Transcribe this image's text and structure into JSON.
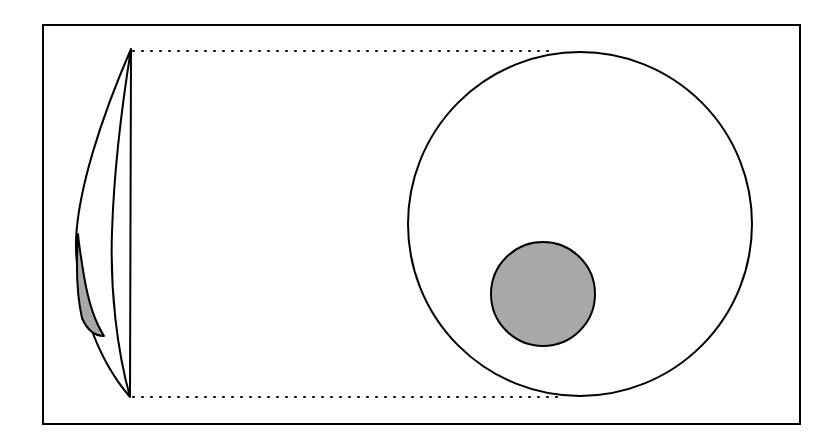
{
  "figure": {
    "title": "Lens and circle geometric diagram",
    "canvas": {
      "width": 838,
      "height": 441,
      "background": "#ffffff"
    },
    "ink_color": "#000000",
    "shade_color": "#a8a8a8",
    "frame": {
      "name": "outer border rectangle",
      "x": 43,
      "y": 25,
      "width": 757,
      "height": 399,
      "stroke": "#000000",
      "stroke_width": 2,
      "fill": "none"
    },
    "guides": [
      {
        "name": "upper dotted tangent line",
        "style": "dotted",
        "x1": 133,
        "y1": 51,
        "x2": 556,
        "y2": 51,
        "stroke": "#000000",
        "stroke_width": 2,
        "dash": "1 8"
      },
      {
        "name": "lower dotted tangent line",
        "style": "dotted",
        "x1": 133,
        "y1": 397,
        "x2": 558,
        "y2": 397,
        "stroke": "#000000",
        "stroke_width": 2,
        "dash": "1 8"
      }
    ],
    "lens": {
      "name": "thin crescent lens shape",
      "top_tip": {
        "x": 131,
        "y": 49
      },
      "bottom_tip": {
        "x": 130,
        "y": 397
      },
      "outer_arc_extreme": {
        "x": 76,
        "y": 240
      },
      "inner_arc_extreme": {
        "x": 112,
        "y": 232
      },
      "stroke": "#000000",
      "stroke_width": 2,
      "fill": "#ffffff",
      "outer_path": "M131,49 C101,118 78,190 76,240 C75,300 98,360 130,397",
      "inner_path": "M130,397 C117,350 110,290 112,232 C114,170 122,105 131,49"
    },
    "shaded_sliver": {
      "name": "gray shaded sliver inside lens",
      "fill": "#a8a8a8",
      "stroke": "#000000",
      "stroke_width": 2,
      "top": {
        "x": 78,
        "y": 234
      },
      "bottom": {
        "x": 104,
        "y": 336
      },
      "path": "M78,234 C76,265 76,292 82,318 C88,332 96,336 104,336 C95,322 88,300 84,276 C81,258 79,244 78,234 Z"
    },
    "big_circle": {
      "name": "large outline circle",
      "cx": 580,
      "cy": 224,
      "r": 172,
      "stroke": "#000000",
      "stroke_width": 2,
      "fill": "none"
    },
    "inner_circle": {
      "name": "small gray filled circle",
      "cx": 543,
      "cy": 294,
      "r": 52,
      "stroke": "#000000",
      "stroke_width": 2,
      "fill": "#a8a8a8"
    }
  }
}
